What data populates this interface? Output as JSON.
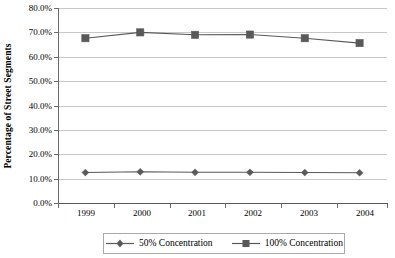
{
  "chart_data": {
    "type": "line",
    "title": "",
    "xlabel": "",
    "ylabel": "Percentage of Street Segments",
    "categories": [
      "1999",
      "2000",
      "2001",
      "2002",
      "2003",
      "2004"
    ],
    "ylim": [
      0,
      80
    ],
    "ytick_values": [
      80,
      70,
      60,
      50,
      40,
      30,
      20,
      10,
      0
    ],
    "ytick_labels": [
      "80.0%",
      "70.0%",
      "60.0%",
      "50.0%",
      "40.0%",
      "30.0%",
      "20.0%",
      "10.0%",
      "0.0%"
    ],
    "grid": true,
    "legend_position": "bottom",
    "series": [
      {
        "name": "50% Concentration",
        "marker": "diamond",
        "color": "#595959",
        "values": [
          12.5,
          12.8,
          12.6,
          12.6,
          12.5,
          12.4
        ]
      },
      {
        "name": "100% Concentration",
        "marker": "square",
        "color": "#595959",
        "values": [
          67.6,
          70.0,
          69.0,
          69.1,
          67.6,
          65.6
        ]
      }
    ]
  },
  "axis": {
    "y_title": "Percentage of Street Segments",
    "y_labels": [
      "80.0%",
      "70.0%",
      "60.0%",
      "50.0%",
      "40.0%",
      "30.0%",
      "20.0%",
      "10.0%",
      "0.0%"
    ],
    "x_labels": [
      "1999",
      "2000",
      "2001",
      "2002",
      "2003",
      "2004"
    ]
  },
  "legend": {
    "entries": [
      {
        "label": "50% Concentration",
        "marker": "diamond-marker-icon"
      },
      {
        "label": "100% Concentration",
        "marker": "square-marker-icon"
      }
    ]
  },
  "colors": {
    "series_line": "#595959",
    "gridline": "#c8c8c8",
    "axis": "#5a5a5a",
    "background": "#ffffff"
  }
}
